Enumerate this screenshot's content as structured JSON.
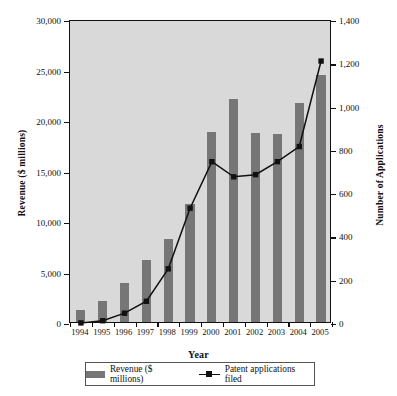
{
  "chart_data": {
    "type": "bar",
    "title": "",
    "xlabel": "Year",
    "ylabel": "Revenue ($ millions)",
    "ylabel_secondary": "Number of Applications",
    "categories": [
      "1994",
      "1995",
      "1996",
      "1997",
      "1998",
      "1999",
      "2000",
      "2001",
      "2002",
      "2003",
      "2004",
      "2005"
    ],
    "ylim": [
      0,
      30000
    ],
    "ylim_secondary": [
      0,
      1400
    ],
    "yticks": [
      "0",
      "5,000",
      "10,000",
      "15,000",
      "20,000",
      "25,000",
      "30,000"
    ],
    "ytick_values": [
      0,
      5000,
      10000,
      15000,
      20000,
      25000,
      30000
    ],
    "yticks_secondary": [
      "0",
      "200",
      "400",
      "600",
      "800",
      "1,000",
      "1,200",
      "1,400"
    ],
    "ytick_values_secondary": [
      0,
      200,
      400,
      600,
      800,
      1000,
      1200,
      1400
    ],
    "grid": false,
    "legend_position": "bottom",
    "series": [
      {
        "name": "Revenue ($ millions)",
        "type": "bar",
        "axis": "left",
        "color": "#767676",
        "values": [
          1200,
          2100,
          3900,
          6100,
          8200,
          11700,
          18800,
          22100,
          18700,
          18600,
          21700,
          24500
        ]
      },
      {
        "name": "Patent applications filed",
        "type": "line",
        "axis": "right",
        "color": "#111111",
        "marker": "square",
        "values": [
          5,
          15,
          50,
          105,
          255,
          535,
          750,
          680,
          690,
          750,
          820,
          1215
        ]
      }
    ]
  },
  "legend": {
    "items": [
      {
        "label": "Revenue ($ millions)",
        "marker": "bar-swatch"
      },
      {
        "label": "Patent applications filed",
        "marker": "line-marker"
      }
    ]
  },
  "colors": {
    "bar": "#767676",
    "line": "#111111",
    "plot_background": "#d9d9d9",
    "axis": "#111111",
    "page_background": "#ffffff"
  }
}
